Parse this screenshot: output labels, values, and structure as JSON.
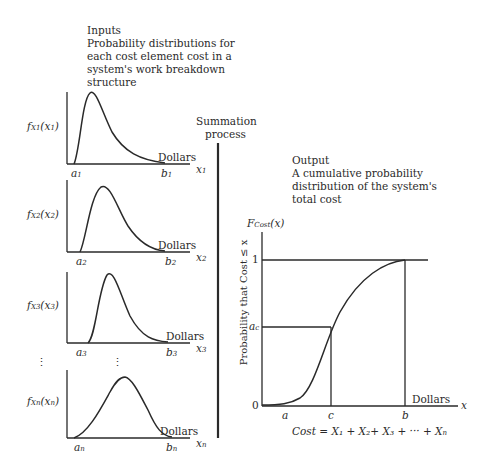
{
  "inputs": {
    "title": "Inputs",
    "description_lines": [
      "Probability distributions for",
      "each cost element cost in a",
      "system's work breakdown",
      "structure"
    ]
  },
  "summation": {
    "line1": "Summation",
    "line2": "process"
  },
  "output": {
    "title": "Output",
    "description_lines": [
      "A cumulative probability",
      "distribution of the system's",
      "total cost"
    ]
  },
  "input_panels": [
    {
      "f_label": "f",
      "sub": "X",
      "subsub": "1",
      "arg": "(x",
      "argsub": "1",
      "a": "a",
      "a_sub": "1",
      "b": "b",
      "b_sub": "1",
      "x": "x",
      "x_sub": "1",
      "units": "Dollars"
    },
    {
      "f_label": "f",
      "sub": "X",
      "subsub": "2",
      "arg": "(x",
      "argsub": "2",
      "a": "a",
      "a_sub": "2",
      "b": "b",
      "b_sub": "2",
      "x": "x",
      "x_sub": "2",
      "units": "Dollars"
    },
    {
      "f_label": "f",
      "sub": "X",
      "subsub": "3",
      "arg": "(x",
      "argsub": "3",
      "a": "a",
      "a_sub": "3",
      "b": "b",
      "b_sub": "3",
      "x": "x",
      "x_sub": "3",
      "units": "Dollars"
    },
    {
      "f_label": "f",
      "sub": "X",
      "subsub": "n",
      "arg": "(x",
      "argsub": "n",
      "a": "a",
      "a_sub": "n",
      "b": "b",
      "b_sub": "n",
      "x": "x",
      "x_sub": "n",
      "units": "Dollars"
    }
  ],
  "ellipsis": "⋮",
  "cdf_chart": {
    "y_title_F": "F",
    "y_title_sub": "Cost",
    "y_title_arg": "(x)",
    "y_axis_label": "Probability that Cost ≤ x",
    "y_ticks": {
      "one": "1",
      "ac": "a",
      "ac_sub": "c",
      "zero": "0"
    },
    "x_ticks": {
      "a": "a",
      "c": "c",
      "b": "b"
    },
    "x_axis_var": "x",
    "units": "Dollars",
    "formula": "Cost = X₁ + X₂+ X₃ + ··· + X",
    "formula_last_sub": "n"
  },
  "colors": {
    "ink": "#2a2a2a",
    "background": "#ffffff"
  }
}
